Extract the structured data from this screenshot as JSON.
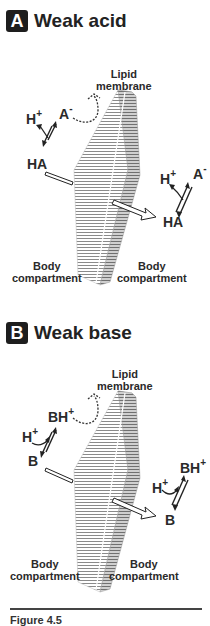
{
  "panels": [
    {
      "badge": "A",
      "title": "Weak acid",
      "membrane_label": [
        "Lipid",
        "membrane"
      ],
      "left_species": {
        "proton": "H",
        "charge_plus": "+",
        "ion": "A",
        "charge_minus": "-",
        "neutral": "HA"
      },
      "right_species": {
        "proton": "H",
        "charge_plus": "+",
        "ion": "A",
        "charge_minus": "-",
        "neutral": "HA"
      },
      "compartment_left": [
        "Body",
        "compartment"
      ],
      "compartment_right": [
        "Body",
        "compartment"
      ]
    },
    {
      "badge": "B",
      "title": "Weak base",
      "membrane_label": [
        "Lipid",
        "membrane"
      ],
      "left_species": {
        "proton": "H",
        "charge_plus": "+",
        "ion": "BH",
        "ion_charge": "+",
        "neutral": "B"
      },
      "right_species": {
        "proton": "H",
        "charge_plus": "+",
        "ion": "BH",
        "ion_charge": "+",
        "neutral": "B"
      },
      "compartment_left": [
        "Body",
        "compartment"
      ],
      "compartment_right": [
        "Body",
        "compartment"
      ]
    }
  ],
  "caption": "Figure 4.5"
}
